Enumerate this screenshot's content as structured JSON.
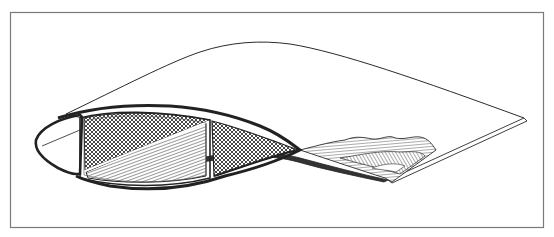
{
  "diagram": {
    "text_labels": [],
    "colors": {
      "background": "#ffffff",
      "frame": "#7a7a7a",
      "ink": "#2a2a2a",
      "hatch": "#3a3a3a"
    },
    "frame": {
      "x": 10,
      "y": 12,
      "width": 533,
      "height": 215
    },
    "parts": [
      {
        "id": "upper-surface-outline",
        "kind": "curve"
      },
      {
        "id": "trailing-edge",
        "kind": "line"
      },
      {
        "id": "leading-edge-nose",
        "kind": "shell"
      },
      {
        "id": "main-box-spar-upper-cell",
        "kind": "crosshatch"
      },
      {
        "id": "main-box-spar-lower-cell",
        "kind": "line-hatch"
      },
      {
        "id": "rear-cell",
        "kind": "crosshatch"
      },
      {
        "id": "torn-skin-section",
        "kind": "line-hatch"
      }
    ]
  }
}
